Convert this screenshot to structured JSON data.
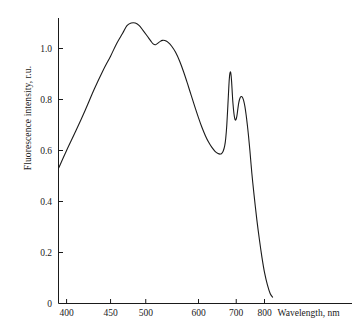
{
  "chart_data": {
    "type": "line",
    "title": "",
    "subtitle": "",
    "xlabel": "Wavelength, nm",
    "ylabel": "Fluorescence intensity, r.u.",
    "x_scale": "reciprocal",
    "xlim": [
      385,
      845
    ],
    "ylim": [
      0,
      1.16
    ],
    "grid": false,
    "legend": null,
    "xticks": [
      400,
      450,
      500,
      600,
      700,
      800
    ],
    "xtick_labels": [
      "400",
      "450",
      "500",
      "600",
      "700",
      "800"
    ],
    "yticks": [
      0,
      0.2,
      0.4,
      0.6,
      0.8,
      1.0
    ],
    "ytick_labels": [
      "0",
      "0.2",
      "0.4",
      "0.6",
      "0.8",
      "1.0"
    ],
    "line_color": "#1a1a1a",
    "line_width": 1.1,
    "series": [
      {
        "name": "Fluorescence spectrum",
        "x": [
          392,
          400,
          410,
          420,
          430,
          440,
          450,
          458,
          466,
          472,
          478,
          484,
          490,
          496,
          502,
          508,
          512,
          516,
          520,
          524,
          528,
          532,
          538,
          545,
          552,
          560,
          568,
          576,
          584,
          592,
          600,
          608,
          616,
          624,
          632,
          640,
          648,
          654,
          658,
          662,
          666,
          669,
          672,
          675,
          678,
          680,
          682,
          684,
          686,
          688,
          690,
          693,
          696,
          699,
          702,
          705,
          708,
          712,
          716,
          720,
          724,
          728,
          732,
          736,
          740,
          745,
          752,
          760,
          770,
          780,
          790,
          800,
          812,
          824,
          834
        ],
        "y": [
          0.53,
          0.6,
          0.68,
          0.76,
          0.84,
          0.91,
          0.97,
          1.02,
          1.06,
          1.09,
          1.1,
          1.1,
          1.09,
          1.07,
          1.05,
          1.03,
          1.018,
          1.015,
          1.021,
          1.028,
          1.032,
          1.031,
          1.024,
          1.008,
          0.985,
          0.95,
          0.908,
          0.862,
          0.815,
          0.77,
          0.728,
          0.69,
          0.658,
          0.632,
          0.612,
          0.597,
          0.588,
          0.586,
          0.589,
          0.598,
          0.618,
          0.648,
          0.7,
          0.775,
          0.855,
          0.893,
          0.908,
          0.9,
          0.87,
          0.825,
          0.785,
          0.745,
          0.722,
          0.721,
          0.735,
          0.762,
          0.788,
          0.806,
          0.812,
          0.808,
          0.795,
          0.772,
          0.74,
          0.702,
          0.66,
          0.6,
          0.51,
          0.425,
          0.33,
          0.25,
          0.18,
          0.122,
          0.073,
          0.038,
          0.025
        ]
      }
    ]
  },
  "axes": {
    "y_axis_title": "Fluorescence intensity, r.u.",
    "x_axis_title": "Wavelength, nm"
  }
}
